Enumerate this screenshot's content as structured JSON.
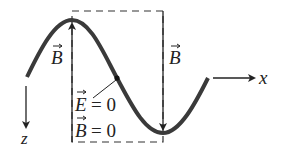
{
  "diagram": {
    "type": "electromagnetic wave snapshot",
    "axes": {
      "x_label": "x",
      "z_label": "z"
    },
    "vectors": {
      "left_field_label": "B",
      "right_field_label": "B"
    },
    "annotation": {
      "line1_symbol": "E",
      "line1_value": "= 0",
      "line2_symbol": "B",
      "line2_value": "= 0"
    },
    "colors": {
      "curve": "#3a3a3a",
      "ink": "#222222",
      "background": "#ffffff"
    }
  }
}
